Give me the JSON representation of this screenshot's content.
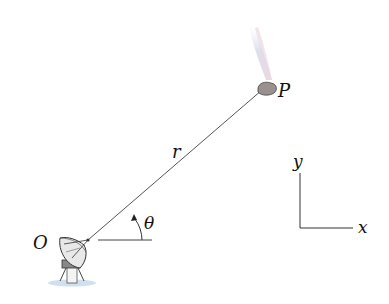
{
  "diagram": {
    "labels": {
      "origin": "O",
      "point": "P",
      "radius": "r",
      "angle": "θ",
      "x_axis": "x",
      "y_axis": "y"
    },
    "objects": {
      "origin_object": "radar-dish",
      "target_object": "meteor-with-trail"
    },
    "colors": {
      "line": "#555555",
      "text": "#111111",
      "rock": "#9a9090",
      "trail": "#c8cde0"
    }
  }
}
